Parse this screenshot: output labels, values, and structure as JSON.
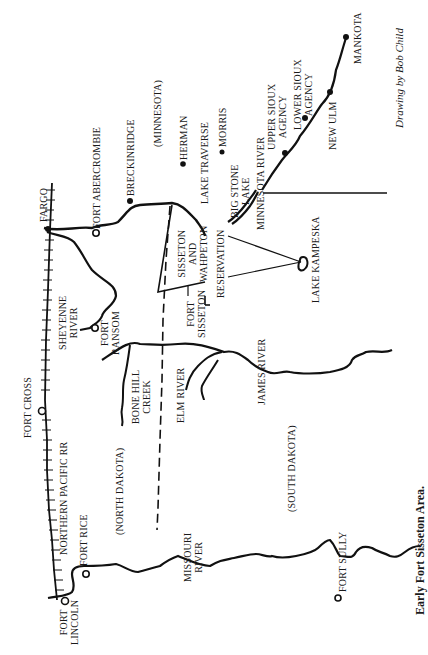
{
  "caption": "Early Fort Sisseton Area.",
  "credit": "Drawing by Bob Child",
  "regions": {
    "minnesota": "(MINNESOTA)",
    "north_dakota": "(NORTH DAKOTA)",
    "south_dakota": "(SOUTH DAKOTA)",
    "reservation": "SISSETON\nAND\nWAHPETON",
    "reservation_label2": "RESERVATION"
  },
  "places": {
    "fargo": "FARGO",
    "fort_abercrombie": "FORT ABERCROMBIE",
    "breckinridge": "BRECKINRIDGE",
    "herman": "HERMAN",
    "morris": "MORRIS",
    "lake_traverse": "LAKE TRAVERSE",
    "big_stone_lake": "BIG STONE\nLAKE",
    "minnesota_river": "MINNESOTA RIVER",
    "upper_sioux_agency": "UPPER SIOUX\nAGENCY",
    "lower_sioux_agency": "LOWER SIOUX\nAGENCY",
    "new_ulm": "NEW ULM",
    "mankota": "MANKOTA",
    "lake_kampeska": "LAKE KAMPESKA",
    "fort_sisseton": "FORT\nSISSETON",
    "sheyenne_river": "SHEYENNE\nRIVER",
    "fort_ransom": "FORT\nRANSOM",
    "fort_cross": "FORT CROSS",
    "bone_hill_creek": "BONE HILL\nCREEK",
    "elm_river": "ELM RIVER",
    "james_river": "JAMES RIVER",
    "northern_pacific_rr": "NORTHERN PACIFIC RR",
    "fort_rice": "FORT RICE",
    "fort_lincoln": "FORT\nLINCOLN",
    "missouri_river": "MISSOURI\nRIVER",
    "fort_sully": "FORT SULLY"
  },
  "legend_symbols": {
    "town": "filled-dot",
    "fort": "open-circle",
    "railroad": "hatched-line",
    "state_border": "dashed-line"
  }
}
